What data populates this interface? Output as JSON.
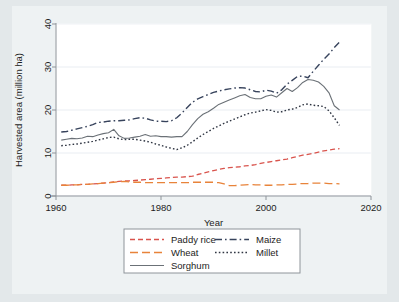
{
  "figure": {
    "background_color": "#e3e8ea",
    "panel_color": "#ffffff",
    "paper_color": "#eef2f3",
    "frame_color": "#8e949a",
    "grid_color": "#e9edf2"
  },
  "chart_data": {
    "type": "line",
    "title": "",
    "xlabel": "Year",
    "ylabel": "Harvested area (million ha)",
    "xlim": [
      1960,
      2020
    ],
    "ylim": [
      0,
      40
    ],
    "xticks": [
      1960,
      1980,
      2000,
      2020
    ],
    "yticks": [
      0,
      10,
      20,
      30,
      40
    ],
    "grid": "horizontal",
    "legend_position": "below",
    "x": [
      1961,
      1962,
      1963,
      1964,
      1965,
      1966,
      1967,
      1968,
      1969,
      1970,
      1971,
      1972,
      1973,
      1974,
      1975,
      1976,
      1977,
      1978,
      1979,
      1980,
      1981,
      1982,
      1983,
      1984,
      1985,
      1986,
      1987,
      1988,
      1989,
      1990,
      1991,
      1992,
      1993,
      1994,
      1995,
      1996,
      1997,
      1998,
      1999,
      2000,
      2001,
      2002,
      2003,
      2004,
      2005,
      2006,
      2007,
      2008,
      2009,
      2010,
      2011,
      2012,
      2013,
      2014
    ],
    "series": [
      {
        "name": "Paddy rice",
        "color": "#d9544d",
        "dash": "dashed",
        "width": 1.3,
        "values": [
          2.5,
          2.5,
          2.6,
          2.6,
          2.7,
          2.7,
          2.8,
          2.9,
          3.0,
          3.1,
          3.3,
          3.4,
          3.5,
          3.5,
          3.6,
          3.7,
          3.8,
          3.9,
          4.0,
          4.1,
          4.2,
          4.3,
          4.4,
          4.4,
          4.5,
          4.6,
          5.0,
          5.3,
          5.6,
          5.9,
          6.2,
          6.4,
          6.6,
          6.7,
          6.8,
          7.0,
          7.1,
          7.3,
          7.6,
          7.8,
          8.0,
          8.2,
          8.4,
          8.6,
          8.9,
          9.2,
          9.5,
          9.7,
          9.9,
          10.2,
          10.5,
          10.7,
          10.9,
          11.0
        ]
      },
      {
        "name": "Wheat",
        "color": "#e8833a",
        "dash": "long-dashed",
        "width": 1.3,
        "values": [
          2.5,
          2.5,
          2.6,
          2.6,
          2.7,
          2.7,
          2.8,
          2.9,
          3.0,
          3.1,
          3.2,
          3.3,
          3.4,
          3.3,
          3.2,
          3.2,
          3.1,
          3.1,
          3.1,
          3.1,
          3.1,
          3.1,
          3.1,
          3.1,
          3.1,
          3.2,
          3.2,
          3.2,
          3.2,
          3.2,
          3.1,
          2.8,
          2.4,
          2.4,
          2.5,
          2.6,
          2.7,
          2.6,
          2.6,
          2.5,
          2.5,
          2.6,
          2.6,
          2.7,
          2.7,
          2.8,
          2.9,
          2.9,
          3.0,
          3.0,
          3.0,
          2.9,
          2.9,
          2.8
        ]
      },
      {
        "name": "Sorghum",
        "color": "#6b7177",
        "dash": "solid",
        "width": 1.1,
        "values": [
          13.0,
          13.2,
          13.4,
          13.3,
          13.5,
          13.9,
          13.8,
          14.2,
          14.5,
          14.7,
          15.5,
          14.0,
          13.4,
          13.5,
          13.7,
          13.9,
          14.3,
          13.9,
          14.0,
          13.8,
          13.8,
          13.7,
          13.8,
          13.8,
          15.0,
          16.6,
          18.0,
          19.0,
          19.6,
          20.4,
          21.3,
          21.8,
          22.3,
          22.8,
          23.3,
          23.6,
          22.9,
          22.6,
          22.6,
          23.2,
          23.5,
          23.0,
          24.0,
          25.0,
          24.3,
          25.2,
          26.4,
          27.1,
          26.9,
          26.5,
          25.5,
          24.0,
          21.0,
          20.0
        ]
      },
      {
        "name": "Maize",
        "color": "#37435c",
        "dash": "dash-dot",
        "width": 1.4,
        "values": [
          14.9,
          15.0,
          15.3,
          15.6,
          15.9,
          16.2,
          16.6,
          17.1,
          17.2,
          17.4,
          17.5,
          17.5,
          17.6,
          17.7,
          18.0,
          18.2,
          18.1,
          17.7,
          17.4,
          17.4,
          17.3,
          17.5,
          18.2,
          19.3,
          20.6,
          21.8,
          22.6,
          23.1,
          23.6,
          24.1,
          24.4,
          24.7,
          24.9,
          25.1,
          25.2,
          25.1,
          24.7,
          24.3,
          24.2,
          24.6,
          24.4,
          23.9,
          24.7,
          26.0,
          26.9,
          27.8,
          27.9,
          27.5,
          29.0,
          30.4,
          31.8,
          33.0,
          34.5,
          35.8
        ]
      },
      {
        "name": "Millet",
        "color": "#2f3542",
        "dash": "dotted",
        "width": 1.4,
        "values": [
          11.7,
          11.8,
          12.0,
          12.1,
          12.3,
          12.5,
          12.7,
          13.0,
          13.3,
          13.6,
          13.7,
          13.3,
          13.1,
          13.2,
          13.2,
          13.0,
          12.8,
          12.5,
          12.1,
          11.8,
          11.4,
          11.1,
          10.8,
          11.2,
          11.8,
          12.6,
          13.5,
          14.3,
          15.0,
          15.7,
          16.3,
          16.9,
          17.4,
          17.9,
          18.4,
          18.9,
          19.3,
          19.5,
          19.8,
          20.1,
          19.9,
          19.5,
          19.6,
          20.0,
          20.2,
          20.6,
          21.2,
          21.4,
          21.1,
          21.0,
          20.8,
          19.8,
          18.2,
          16.4
        ]
      }
    ]
  },
  "legend": {
    "entries": [
      {
        "label": "Paddy rice"
      },
      {
        "label": "Wheat"
      },
      {
        "label": "Sorghum"
      },
      {
        "label": "Maize"
      },
      {
        "label": "Millet"
      }
    ]
  }
}
